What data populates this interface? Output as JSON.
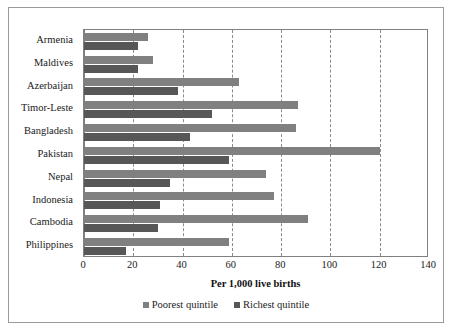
{
  "chart_data": {
    "type": "bar",
    "orientation": "horizontal",
    "title": "",
    "xlabel": "Per 1,000 live births",
    "ylabel": "",
    "xlim": [
      0,
      140
    ],
    "xticks": [
      0,
      20,
      40,
      60,
      80,
      100,
      120,
      140
    ],
    "grid": true,
    "grid_axis": "x",
    "grid_style": "dashed",
    "legend_position": "bottom",
    "categories": [
      "Armenia",
      "Maldives",
      "Azerbaijan",
      "Timor-Leste",
      "Bangladesh",
      "Pakistan",
      "Nepal",
      "Indonesia",
      "Cambodia",
      "Philippines"
    ],
    "series": [
      {
        "name": "Poorest quintile",
        "color": "#808080",
        "values": [
          26,
          28,
          63,
          87,
          86,
          120,
          74,
          77,
          91,
          59
        ]
      },
      {
        "name": "Richest quintile",
        "color": "#575757",
        "values": [
          22,
          22,
          38,
          52,
          43,
          59,
          35,
          31,
          30,
          17
        ]
      }
    ]
  },
  "legend": {
    "items": [
      {
        "label": "Poorest quintile",
        "swatch": "poorest"
      },
      {
        "label": "Richest quintile",
        "swatch": "richest"
      }
    ]
  },
  "colors": {
    "poorest": "#808080",
    "richest": "#575757",
    "frame": "#9a9a9a",
    "axis": "#808080",
    "grid": "#8a8a8a",
    "text": "#1a1a1a",
    "background": "#ffffff"
  }
}
